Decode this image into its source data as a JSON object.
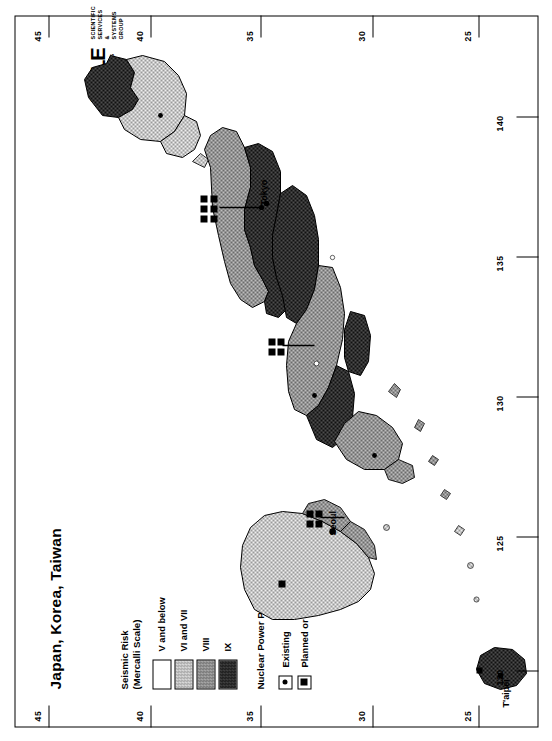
{
  "sheet": {
    "title": "Japan, Korea, Taiwan",
    "orientation": "rotated-90-ccw"
  },
  "legend_seismic": {
    "title_line1": "Seismic Risk",
    "title_line2": "(Mercalli Scale)",
    "items": [
      {
        "label": "V and below",
        "swatch": "white",
        "color": "#ffffff"
      },
      {
        "label": "VI and VII",
        "swatch": "light-stipple",
        "color": "#c9c9c9"
      },
      {
        "label": "VIII",
        "swatch": "mid-stipple",
        "color": "#8f8f8f"
      },
      {
        "label": "IX",
        "swatch": "dark-stipple",
        "color": "#303030"
      }
    ]
  },
  "legend_npp": {
    "title": "Nuclear Power Plants",
    "items": [
      {
        "label": "Existing",
        "key": "dot-in-box"
      },
      {
        "label": "Planned or under construction",
        "key": "square-in-box"
      }
    ]
  },
  "logo": {
    "wordmark": "WYLE",
    "sub_left": "LABORATORIES",
    "sub_right_line1": "SCIENTIFIC SERVICES",
    "sub_right_line2": "& SYSTEMS",
    "sub_right_line3": "GROUP"
  },
  "graticule": {
    "latitude_labels": [
      "45",
      "40",
      "35",
      "30",
      "25"
    ],
    "longitude_labels": [
      "120",
      "125",
      "130",
      "135",
      "140"
    ]
  },
  "cities": [
    {
      "name": "Tokyo"
    },
    {
      "name": "Seoul"
    },
    {
      "name": "T'aipei"
    }
  ],
  "map_data": {
    "type": "choropleth-map",
    "region": "Japan, Korea, Taiwan",
    "variable": "Seismic Risk (Modified Mercalli Intensity)",
    "classes": [
      "V and below",
      "VI and VII",
      "VIII",
      "IX"
    ],
    "point_overlay": "Nuclear Power Plants",
    "point_classes": [
      "Existing",
      "Planned or under construction"
    ],
    "lat_range": [
      24,
      46
    ],
    "lon_range": [
      118,
      143
    ]
  }
}
